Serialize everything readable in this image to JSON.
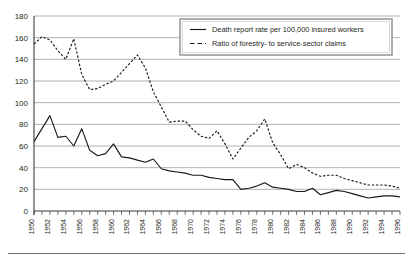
{
  "chart_data": {
    "type": "line",
    "title": "",
    "subtitle": "",
    "xlabel": "",
    "ylabel": "",
    "xlim": [
      1950,
      1996
    ],
    "ylim": [
      0,
      180
    ],
    "ytick_step": 20,
    "xtick_step": 1,
    "xtick_label_step": 2,
    "grid": true,
    "legend_position": "top-right",
    "yticks": [
      0,
      20,
      40,
      60,
      80,
      100,
      120,
      140,
      160,
      180
    ],
    "ytick_labels": [
      "0",
      "20",
      "40",
      "60",
      "80",
      "100",
      "120",
      "140",
      "160",
      "180"
    ],
    "x": [
      1950,
      1951,
      1952,
      1953,
      1954,
      1955,
      1956,
      1957,
      1958,
      1959,
      1960,
      1961,
      1962,
      1963,
      1964,
      1965,
      1966,
      1967,
      1968,
      1969,
      1970,
      1971,
      1972,
      1973,
      1974,
      1975,
      1976,
      1977,
      1978,
      1979,
      1980,
      1981,
      1982,
      1983,
      1984,
      1985,
      1986,
      1987,
      1988,
      1989,
      1990,
      1991,
      1992,
      1993,
      1994,
      1995,
      1996
    ],
    "xtick_labels": [
      "1950",
      "1951",
      "1952",
      "1953",
      "1954",
      "1955",
      "1956",
      "1957",
      "1958",
      "1959",
      "1960",
      "1961",
      "1962",
      "1963",
      "1964",
      "1965",
      "1966",
      "1967",
      "1968",
      "1969",
      "1970",
      "1971",
      "1972",
      "1973",
      "1974",
      "1975",
      "1976",
      "1977",
      "1978",
      "1979",
      "1980",
      "1981",
      "1982",
      "1983",
      "1984",
      "1985",
      "1986",
      "1987",
      "1988",
      "1989",
      "1990",
      "1991",
      "1992",
      "1993",
      "1994",
      "1995",
      "1996"
    ],
    "xtick_labels_shown": [
      "1950",
      "1952",
      "1954",
      "1956",
      "1958",
      "1960",
      "1962",
      "1964",
      "1966",
      "1968",
      "1970",
      "1972",
      "1974",
      "1976",
      "1978",
      "1980",
      "1982",
      "1984",
      "1986",
      "1988",
      "1990",
      "1992",
      "1994",
      "1996"
    ],
    "series": [
      {
        "name": "Death report rate per 100,000 insured workers",
        "style": "solid",
        "color": "#1a1a1a",
        "values": [
          64,
          76,
          88,
          68,
          69,
          60,
          76,
          56,
          51,
          53,
          62,
          50,
          49,
          47,
          45,
          48,
          39,
          37,
          36,
          35,
          33,
          33,
          31,
          30,
          29,
          29,
          20,
          21,
          23,
          26,
          22,
          21,
          20,
          18,
          18,
          21,
          15,
          17,
          19,
          18,
          16,
          14,
          12,
          13,
          14,
          14,
          13
        ]
      },
      {
        "name": "Ratio of forestry- to service-sector claims",
        "style": "dashed",
        "color": "#1a1a1a",
        "values": [
          154,
          161,
          158,
          148,
          140,
          159,
          126,
          112,
          113,
          117,
          120,
          128,
          136,
          144,
          132,
          110,
          96,
          82,
          83,
          83,
          75,
          69,
          67,
          74,
          62,
          48,
          58,
          68,
          74,
          85,
          63,
          52,
          39,
          43,
          40,
          35,
          32,
          33,
          33,
          30,
          28,
          26,
          24,
          24,
          24,
          23,
          21
        ]
      }
    ]
  },
  "legend": {
    "entries": [
      {
        "label": "Death report rate per 100,000 insured workers",
        "style": "solid"
      },
      {
        "label": "Ratio of forestry- to service-sector claims",
        "style": "dashed"
      }
    ]
  }
}
